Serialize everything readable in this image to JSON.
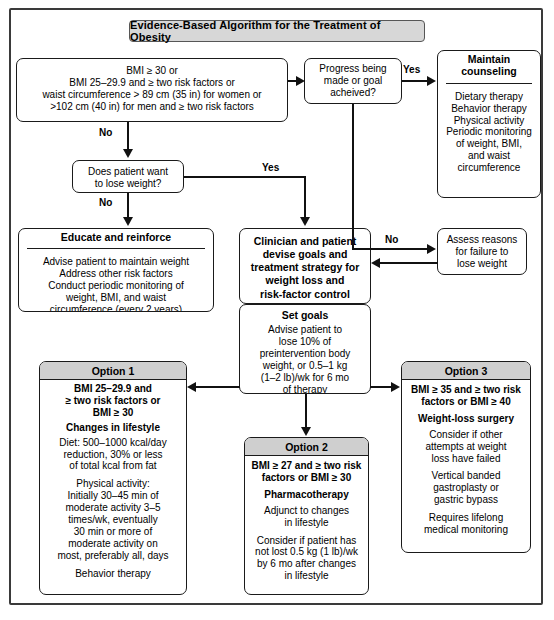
{
  "title": "Evidence-Based Algorithm for the Treatment of Obesity",
  "boxes": {
    "criteria": {
      "lines": [
        "BMI ≥ 30 or",
        "BMI 25–29.9 and ≥ two risk factors or",
        "waist circumference > 89 cm (35 in) for women or",
        ">102 cm (40 in) for men and ≥ two risk factors"
      ]
    },
    "want_lose": {
      "lines": [
        "Does patient want",
        "to lose weight?"
      ]
    },
    "progress": {
      "lines": [
        "Progress being",
        "made or goal",
        "acheived?"
      ]
    },
    "maintain": {
      "header": [
        "Maintain",
        "counseling"
      ],
      "lines": [
        "Dietary therapy",
        "Behavior therapy",
        "Physical activity",
        "Periodic monitoring",
        "of weight, BMI,",
        "and waist",
        "circumference"
      ]
    },
    "assess": {
      "lines": [
        "Assess reasons",
        "for failure to",
        "lose weight"
      ]
    },
    "educate": {
      "header": "Educate and reinforce",
      "lines": [
        "Advise patient to maintain weight",
        "Address other risk factors",
        "Conduct periodic monitoring of",
        "weight, BMI, and waist",
        "circumference (every 2 years)"
      ]
    },
    "clinician": {
      "lines": [
        "Clinician and patient",
        "devise goals and",
        "treatment strategy for",
        "weight loss and",
        "risk-factor control"
      ]
    },
    "setgoals": {
      "header": "Set goals",
      "lines": [
        "Advise patient to",
        "lose 10% of",
        "preintervention body",
        "weight, or 0.5–1 kg",
        "(1–2 lb)/wk for 6 mo",
        "of therapy"
      ]
    },
    "option1": {
      "header": "Option 1",
      "criteria": [
        "BMI 25–29.9 and",
        "≥ two risk factors or",
        "BMI ≥ 30"
      ],
      "subhead": "Changes in lifestyle",
      "group1": [
        "Diet: 500–1000 kcal/day",
        "reduction, 30% or less",
        "of total kcal from fat"
      ],
      "group2": [
        "Physical activity:",
        "Initially 30–45 min of",
        "moderate activity 3–5",
        "times/wk, eventually",
        "30 min or more of",
        "moderate activity on",
        "most, preferably all, days"
      ],
      "group3": [
        "Behavior therapy"
      ]
    },
    "option2": {
      "header": "Option 2",
      "criteria": [
        "BMI ≥ 27 and ≥ two risk",
        "factors or BMI ≥ 30"
      ],
      "subhead": "Pharmacotherapy",
      "group1": [
        "Adjunct to changes",
        "in lifestyle"
      ],
      "group2": [
        "Consider if patient has",
        "not lost 0.5 kg (1 lb)/wk",
        "by 6 mo after changes",
        "in lifestyle"
      ]
    },
    "option3": {
      "header": "Option 3",
      "criteria": [
        "BMI ≥ 35 and ≥ two risk",
        "factors or BMI ≥ 40"
      ],
      "subhead": "Weight-loss surgery",
      "group1": [
        "Consider if other",
        "attempts at weight",
        "loss have failed"
      ],
      "group2": [
        "Vertical banded",
        "gastroplasty or",
        "gastric bypass"
      ],
      "group3": [
        "Requires lifelong",
        "medical monitoring"
      ]
    }
  },
  "edge_labels": {
    "no_criteria": "No",
    "no_want": "No",
    "yes_want": "Yes",
    "yes_progress": "Yes",
    "no_progress": "No"
  },
  "colors": {
    "title_fill": "#d7d7d7",
    "header_fill": "#cfcfcf",
    "stroke": "#1a1a1a",
    "frame": "#3a3a3a"
  }
}
